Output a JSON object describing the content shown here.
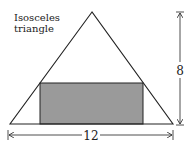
{
  "diagram": {
    "title_line1": "Isosceles",
    "title_line2": "triangle",
    "height_label": "8",
    "base_label": "12",
    "colors": {
      "stroke": "#222222",
      "rect_fill": "#9a9a9a",
      "background": "#ffffff"
    }
  }
}
